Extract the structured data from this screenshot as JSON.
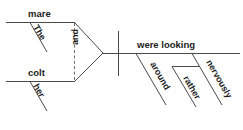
{
  "diagram": {
    "type": "reed-kellogg-sentence-diagram",
    "sentence": "The mare and her colt were looking around rather nervously",
    "colors": {
      "background": "#ffffff",
      "line": "#4a4a4a",
      "dashed_line": "#6d6d6d",
      "text": "#1c1c1c"
    },
    "subject_compound": {
      "conjunction": "and",
      "branches": [
        {
          "noun": "mare",
          "modifier": "The"
        },
        {
          "noun": "colt",
          "modifier": "her"
        }
      ]
    },
    "predicate": {
      "verb": "were looking",
      "modifiers": [
        {
          "word": "around",
          "attached_to": "baseline"
        },
        {
          "word": "nervously",
          "attached_to": "baseline"
        },
        {
          "word": "rather",
          "attached_to": "nervously"
        }
      ]
    },
    "labels": {
      "mare": "mare",
      "the": "The",
      "colt": "colt",
      "her": "her",
      "and": "and",
      "were_looking": "were looking",
      "around": "around",
      "rather": "rather",
      "nervously": "nervously"
    }
  }
}
